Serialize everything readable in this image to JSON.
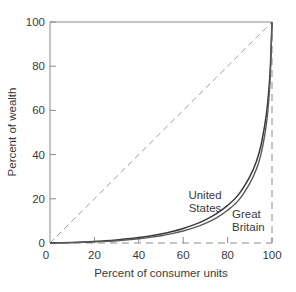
{
  "chart_data": {
    "type": "line",
    "title": "",
    "xlabel": "Percent of consumer units",
    "ylabel": "Percent of wealth",
    "xlim": [
      0,
      100
    ],
    "ylim": [
      0,
      100
    ],
    "grid": false,
    "legend_position": "inline-annotations",
    "xticks": [
      "0",
      "20",
      "40",
      "60",
      "80",
      "100"
    ],
    "xtick_values": [
      0,
      20,
      40,
      60,
      80,
      100
    ],
    "yticks": [
      "0",
      "20",
      "40",
      "60",
      "80",
      "100"
    ],
    "ytick_values": [
      0,
      20,
      40,
      60,
      80,
      100
    ],
    "x": [
      0,
      5,
      10,
      15,
      20,
      25,
      30,
      35,
      40,
      45,
      50,
      55,
      60,
      65,
      70,
      75,
      80,
      85,
      90,
      93,
      95,
      97,
      98,
      99,
      99.5,
      100
    ],
    "series": [
      {
        "name": "United States",
        "label": "United States",
        "color": "#3a3a3a",
        "style": "solid",
        "values": [
          0,
          0.1,
          0.25,
          0.45,
          0.7,
          1.0,
          1.4,
          1.9,
          2.5,
          3.2,
          4.1,
          5.2,
          6.6,
          8.3,
          10.5,
          13.3,
          17.0,
          22.0,
          30.0,
          37.0,
          44.0,
          55.0,
          63.0,
          75.0,
          86.0,
          100
        ]
      },
      {
        "name": "Great Britain",
        "label": "Great Britain",
        "color": "#5a5a5a",
        "style": "solid",
        "values": [
          0,
          0.05,
          0.15,
          0.3,
          0.5,
          0.75,
          1.05,
          1.45,
          1.95,
          2.55,
          3.3,
          4.25,
          5.45,
          6.95,
          8.9,
          11.4,
          14.8,
          19.4,
          27.0,
          33.5,
          40.0,
          50.5,
          58.5,
          71.0,
          83.0,
          100
        ]
      },
      {
        "name": "line of equality",
        "label": "",
        "color": "#9a9a9a",
        "style": "dashed",
        "values": [
          0,
          5,
          10,
          15,
          20,
          25,
          30,
          35,
          40,
          45,
          50,
          55,
          60,
          65,
          70,
          75,
          80,
          85,
          90,
          93,
          95,
          97,
          98,
          99,
          99.5,
          100
        ]
      }
    ],
    "annotations": [
      {
        "text_line1": "United",
        "text_line2": "States",
        "x": 72,
        "y": 20
      },
      {
        "text_line1": "Great",
        "text_line2": "Britain",
        "x": 90,
        "y": 13
      }
    ]
  }
}
